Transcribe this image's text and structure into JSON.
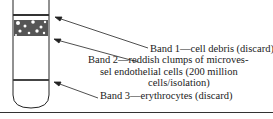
{
  "diagram": {
    "bands": [
      {
        "label_lines": [
          "Band 1—cell debris (discard)"
        ]
      },
      {
        "label_lines": [
          "Band 2—reddish clumps of microves-",
          "sel endothelial cells (200 million",
          "cells/isolation)"
        ]
      },
      {
        "label_lines": [
          "Band 3—erythrocytes (discard)"
        ]
      }
    ]
  }
}
